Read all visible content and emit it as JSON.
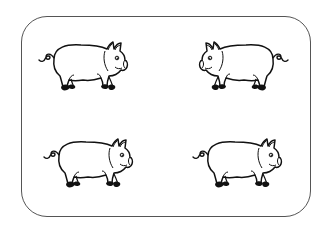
{
  "illustration": {
    "subject": "four pigs",
    "frame": {
      "shape": "rounded-rectangle",
      "stroke_color": "#555555",
      "background": "#ffffff"
    },
    "line_color": "#111111",
    "pigs": [
      {
        "position": "top-left",
        "facing": "right",
        "x": 37,
        "y": 39
      },
      {
        "position": "top-right",
        "facing": "left",
        "x": 196,
        "y": 39
      },
      {
        "position": "bottom-left",
        "facing": "right",
        "x": 42,
        "y": 136
      },
      {
        "position": "bottom-right",
        "facing": "right",
        "x": 191,
        "y": 136
      }
    ]
  }
}
